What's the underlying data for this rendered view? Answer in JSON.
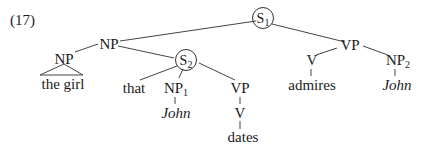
{
  "example_number": "(17)",
  "tree": {
    "S1": {
      "label": "S",
      "sub": "1"
    },
    "NP_top": {
      "label": "NP"
    },
    "NP_head": {
      "label": "NP"
    },
    "the_girl": {
      "label": "the girl"
    },
    "S2": {
      "label": "S",
      "sub": "2"
    },
    "that": {
      "label": "that"
    },
    "NP1": {
      "label": "NP",
      "sub": "1"
    },
    "John1": {
      "label": "John"
    },
    "VP_inner": {
      "label": "VP"
    },
    "V_inner": {
      "label": "V"
    },
    "dates": {
      "label": "dates"
    },
    "VP_main": {
      "label": "VP"
    },
    "V_main": {
      "label": "V"
    },
    "admires": {
      "label": "admires"
    },
    "NP2": {
      "label": "NP",
      "sub": "2"
    },
    "John2": {
      "label": "John"
    }
  }
}
